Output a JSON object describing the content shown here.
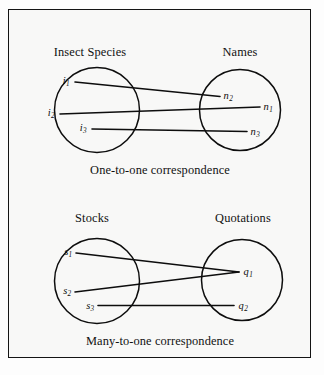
{
  "figure": {
    "background_color": "#f8f8f7",
    "frame_color": "#141414",
    "ink_color": "#0d0d0d"
  },
  "panels": [
    {
      "id": "one-to-one",
      "caption": "One-to-one correspondence",
      "left_set": {
        "heading": "Insect Species",
        "nodes": [
          {
            "base": "i",
            "sub": "1"
          },
          {
            "base": "i",
            "sub": "2"
          },
          {
            "base": "i",
            "sub": "3"
          }
        ]
      },
      "right_set": {
        "heading": "Names",
        "nodes": [
          {
            "base": "n",
            "sub": "2"
          },
          {
            "base": "n",
            "sub": "1"
          },
          {
            "base": "n",
            "sub": "3"
          }
        ]
      },
      "mappings": [
        {
          "from": "i1",
          "to": "n2"
        },
        {
          "from": "i2",
          "to": "n1"
        },
        {
          "from": "i3",
          "to": "n3"
        }
      ]
    },
    {
      "id": "many-to-one",
      "caption": "Many-to-one correspondence",
      "left_set": {
        "heading": "Stocks",
        "nodes": [
          {
            "base": "s",
            "sub": "1"
          },
          {
            "base": "s",
            "sub": "2"
          },
          {
            "base": "s",
            "sub": "3"
          }
        ]
      },
      "right_set": {
        "heading": "Quotations",
        "nodes": [
          {
            "base": "q",
            "sub": "1"
          },
          {
            "base": "q",
            "sub": "2"
          }
        ]
      },
      "mappings": [
        {
          "from": "s1",
          "to": "q1"
        },
        {
          "from": "s2",
          "to": "q1"
        },
        {
          "from": "s3",
          "to": "q2"
        }
      ]
    }
  ],
  "labels": {
    "top_left_heading": "Insect Species",
    "top_right_heading": "Names",
    "top_caption": "One-to-one correspondence",
    "bottom_left_heading": "Stocks",
    "bottom_right_heading": "Quotations",
    "bottom_caption": "Many-to-one correspondence",
    "i1_base": "i",
    "i1_sub": "1",
    "i2_base": "i",
    "i2_sub": "2",
    "i3_base": "i",
    "i3_sub": "3",
    "n2_base": "n",
    "n2_sub": "2",
    "n1_base": "n",
    "n1_sub": "1",
    "n3_base": "n",
    "n3_sub": "3",
    "s1_base": "s",
    "s1_sub": "1",
    "s2_base": "s",
    "s2_sub": "2",
    "s3_base": "s",
    "s3_sub": "3",
    "q1_base": "q",
    "q1_sub": "1",
    "q2_base": "q",
    "q2_sub": "2"
  }
}
